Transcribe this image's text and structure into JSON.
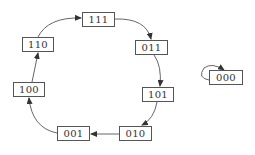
{
  "diagram": {
    "type": "state-transition",
    "colors": {
      "stroke": "#555555",
      "text": "#333333",
      "background": "#ffffff"
    },
    "states": [
      {
        "id": "s111",
        "label": "111",
        "x": 82,
        "y": 12,
        "w": 33,
        "h": 15
      },
      {
        "id": "s011",
        "label": "011",
        "x": 135,
        "y": 40,
        "w": 33,
        "h": 15
      },
      {
        "id": "s101",
        "label": "101",
        "x": 142,
        "y": 87,
        "w": 32,
        "h": 15
      },
      {
        "id": "s010",
        "label": "010",
        "x": 119,
        "y": 126,
        "w": 33,
        "h": 15
      },
      {
        "id": "s001",
        "label": "001",
        "x": 57,
        "y": 126,
        "w": 33,
        "h": 15
      },
      {
        "id": "s100",
        "label": "100",
        "x": 13,
        "y": 82,
        "w": 32,
        "h": 15
      },
      {
        "id": "s110",
        "label": "110",
        "x": 22,
        "y": 37,
        "w": 32,
        "h": 15
      },
      {
        "id": "s000",
        "label": "000",
        "x": 209,
        "y": 70,
        "w": 34,
        "h": 15
      }
    ],
    "transitions": [
      {
        "from": "111",
        "to": "011"
      },
      {
        "from": "011",
        "to": "101"
      },
      {
        "from": "101",
        "to": "010"
      },
      {
        "from": "010",
        "to": "001"
      },
      {
        "from": "001",
        "to": "100"
      },
      {
        "from": "100",
        "to": "110"
      },
      {
        "from": "110",
        "to": "111"
      },
      {
        "from": "000",
        "to": "000"
      }
    ]
  }
}
